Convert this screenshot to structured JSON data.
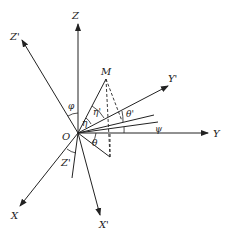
{
  "diagram": {
    "origin_label": "O",
    "point_label": "M",
    "axes": [
      {
        "id": "Z",
        "label": "Z"
      },
      {
        "id": "Zp",
        "label": "Z'"
      },
      {
        "id": "Y",
        "label": "Y"
      },
      {
        "id": "Yp",
        "label": "Y'"
      },
      {
        "id": "X",
        "label": "X"
      },
      {
        "id": "Xp",
        "label": "X'"
      },
      {
        "id": "Zp_lower",
        "label": "Z'"
      }
    ],
    "angles": [
      {
        "id": "phi",
        "label": "φ"
      },
      {
        "id": "eta",
        "label": "η"
      },
      {
        "id": "eta_p",
        "label": "η'"
      },
      {
        "id": "theta_p",
        "label": "θ'"
      },
      {
        "id": "theta",
        "label": "θ"
      },
      {
        "id": "psi",
        "label": "ψ"
      }
    ]
  }
}
